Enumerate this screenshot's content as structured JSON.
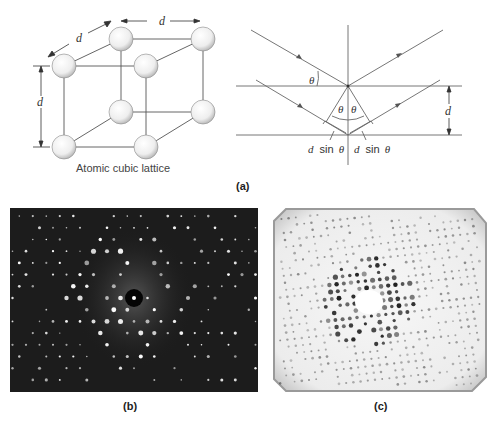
{
  "panel_a": {
    "label": "(a)",
    "lattice": {
      "caption": "Atomic cubic lattice",
      "dim_top": "d",
      "dim_left_diag": "d",
      "dim_vertical": "d",
      "atoms": [
        {
          "x": 64,
          "y": 66
        },
        {
          "x": 121,
          "y": 39
        },
        {
          "x": 203,
          "y": 39
        },
        {
          "x": 146,
          "y": 66
        },
        {
          "x": 121,
          "y": 112
        },
        {
          "x": 203,
          "y": 112
        },
        {
          "x": 64,
          "y": 147
        },
        {
          "x": 146,
          "y": 147
        }
      ],
      "atom_radius": 12
    },
    "bragg": {
      "theta_symbol": "θ",
      "spacing_label": "d",
      "path_left": "d sin θ",
      "path_right": "d sin θ",
      "d_prefix": "d",
      "sin_word": "sin",
      "theta": "θ"
    }
  },
  "panel_b": {
    "label": "(b)",
    "description": "Electron diffraction pattern: bright spots on dark background",
    "background": "#1e1e1e",
    "spot_color": "#ffffff"
  },
  "panel_c": {
    "label": "(c)",
    "description": "X-ray diffraction pattern: dark spots on light background",
    "background": "#f2f2f2",
    "spot_color": "#202020"
  }
}
